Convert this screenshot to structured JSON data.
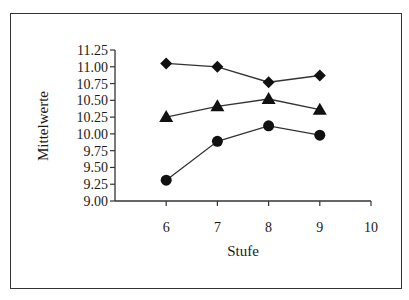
{
  "chart_data": {
    "type": "line",
    "title": "",
    "xlabel": "Stufe",
    "ylabel": "Mittelwerte",
    "x": [
      6,
      7,
      8,
      9
    ],
    "xticks": [
      "6",
      "7",
      "8",
      "9",
      "10"
    ],
    "xlim": [
      5,
      10
    ],
    "yticks": [
      "9.00",
      "9.25",
      "9.50",
      "9.75",
      "10.00",
      "10.25",
      "10.50",
      "10.75",
      "11.00",
      "11.25"
    ],
    "ylim": [
      9.0,
      11.25
    ],
    "grid": false,
    "legend": null,
    "series": [
      {
        "name": "diamond",
        "marker": "diamond",
        "values": [
          11.05,
          11.0,
          10.77,
          10.87
        ]
      },
      {
        "name": "triangle",
        "marker": "triangle",
        "values": [
          10.25,
          10.41,
          10.52,
          10.36
        ]
      },
      {
        "name": "circle",
        "marker": "circle",
        "values": [
          9.31,
          9.89,
          10.12,
          9.98
        ]
      }
    ]
  },
  "colors": {
    "line": "#333333",
    "marker": "#111111",
    "axis": "#333333"
  }
}
